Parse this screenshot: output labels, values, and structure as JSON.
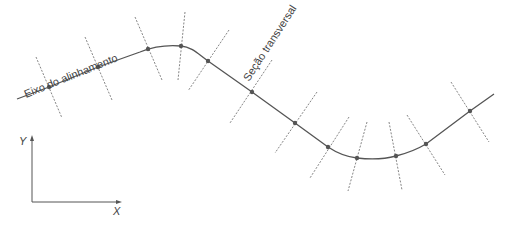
{
  "labels": {
    "axis_label": "Eixo do alinhamento",
    "section_label": "Seção transversal",
    "x_axis": "X",
    "y_axis": "Y"
  },
  "colors": {
    "line": "#555555",
    "tick": "#777777",
    "background": "#ffffff"
  },
  "alignment": {
    "stations": [
      {
        "x": 49,
        "y": 87
      },
      {
        "x": 98,
        "y": 67
      },
      {
        "x": 148,
        "y": 49
      },
      {
        "x": 181,
        "y": 46
      },
      {
        "x": 208,
        "y": 61
      },
      {
        "x": 252,
        "y": 92
      },
      {
        "x": 295,
        "y": 123
      },
      {
        "x": 328,
        "y": 147
      },
      {
        "x": 357,
        "y": 158
      },
      {
        "x": 396,
        "y": 156
      },
      {
        "x": 426,
        "y": 144
      },
      {
        "x": 470,
        "y": 111
      }
    ]
  }
}
